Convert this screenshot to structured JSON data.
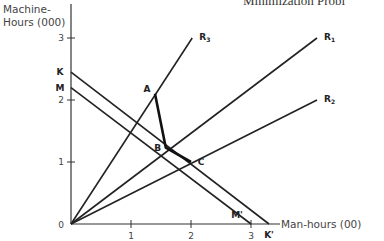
{
  "chart_data": {
    "type": "line",
    "title": "Minimization Probl",
    "xlabel": "Man-hours (00)",
    "ylabel": "Machine-\nHours (000)",
    "ylabel_lines": [
      "Machine-",
      "Hours (000)"
    ],
    "xlim": [
      0,
      3.5
    ],
    "ylim": [
      0,
      3.5
    ],
    "x_ticks": [
      1,
      2,
      3
    ],
    "y_ticks": [
      1,
      2,
      3
    ],
    "origin_label": "0",
    "grid": false,
    "rays": [
      {
        "name": "R3",
        "label": "R",
        "sub": "3",
        "from": [
          0,
          0
        ],
        "to": [
          2.02,
          3.0
        ]
      },
      {
        "name": "R1",
        "label": "R",
        "sub": "1",
        "from": [
          0,
          0
        ],
        "to": [
          4.1,
          3.0
        ]
      },
      {
        "name": "R2",
        "label": "R",
        "sub": "2",
        "from": [
          0,
          0
        ],
        "to": [
          4.1,
          2.0
        ]
      }
    ],
    "isocost_lines": [
      {
        "name": "KK'",
        "start_label": "K",
        "end_label": "K'",
        "from": [
          0,
          2.45
        ],
        "to": [
          3.3,
          0
        ]
      },
      {
        "name": "MM'",
        "start_label": "M",
        "end_label": "M'",
        "from": [
          0,
          2.2
        ],
        "to": [
          3.0,
          0
        ]
      }
    ],
    "isoquant": {
      "points": [
        {
          "label": "A",
          "x": 1.4,
          "y": 2.1
        },
        {
          "label": "B",
          "x": 1.58,
          "y": 1.23
        },
        {
          "label": "C",
          "x": 2.0,
          "y": 1.0
        }
      ]
    }
  }
}
